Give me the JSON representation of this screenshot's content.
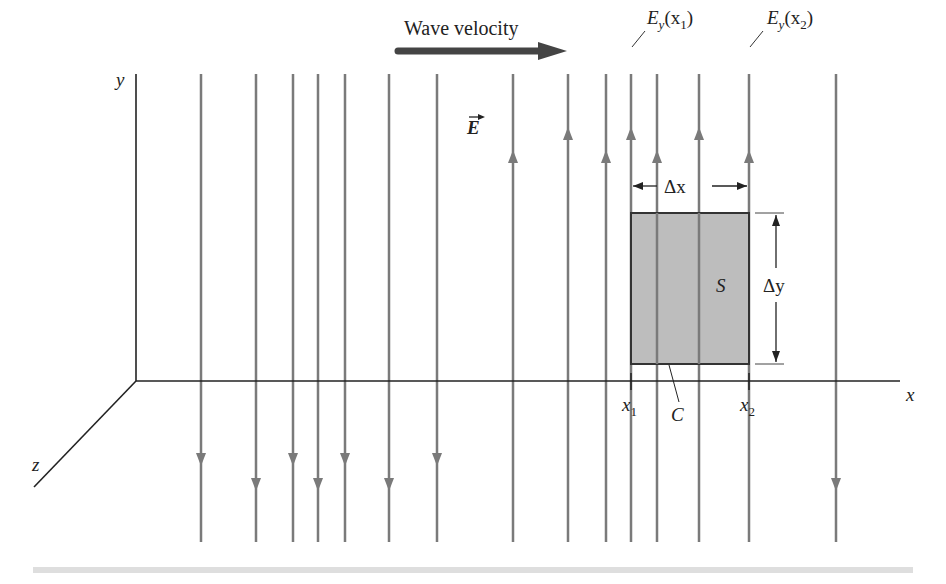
{
  "figure": {
    "wave_velocity_label": "Wave velocity",
    "field_label": "E",
    "axes": {
      "x": "x",
      "y": "y",
      "z": "z"
    },
    "field_labels": {
      "e1_main": "E",
      "e1_sub": "y",
      "e1_arg": "(x",
      "e1_argsub": "1",
      "e1_close": ")",
      "e2_main": "E",
      "e2_sub": "y",
      "e2_arg": "(x",
      "e2_argsub": "2",
      "e2_close": ")"
    },
    "surface_label": "S",
    "contour_label": "C",
    "dx_label": "Δx",
    "dy_label": "Δy",
    "x1_main": "x",
    "x1_sub": "1",
    "x2_main": "x",
    "x2_sub": "2",
    "colors": {
      "field_line": "#7a7a7a",
      "axis": "#222222",
      "surface_fill": "#bdbdbd",
      "velocity_arrow": "#444444",
      "bottom_rule": "#dedede"
    },
    "field_lines": [
      {
        "x": 201,
        "direction": "down",
        "arrow_y": 460
      },
      {
        "x": 256,
        "direction": "down",
        "arrow_y": 485
      },
      {
        "x": 293,
        "direction": "down",
        "arrow_y": 460
      },
      {
        "x": 318,
        "direction": "down",
        "arrow_y": 485
      },
      {
        "x": 345,
        "direction": "down",
        "arrow_y": 460
      },
      {
        "x": 389,
        "direction": "down",
        "arrow_y": 485
      },
      {
        "x": 437,
        "direction": "down",
        "arrow_y": 460
      },
      {
        "x": 513,
        "direction": "up",
        "arrow_y": 156
      },
      {
        "x": 568,
        "direction": "up",
        "arrow_y": 133
      },
      {
        "x": 606,
        "direction": "up",
        "arrow_y": 156
      },
      {
        "x": 631,
        "direction": "up",
        "arrow_y": 133
      },
      {
        "x": 657,
        "direction": "up",
        "arrow_y": 156
      },
      {
        "x": 699,
        "direction": "up",
        "arrow_y": 133
      },
      {
        "x": 749,
        "direction": "up",
        "arrow_y": 156
      },
      {
        "x": 836,
        "direction": "down",
        "arrow_y": 485
      }
    ]
  }
}
